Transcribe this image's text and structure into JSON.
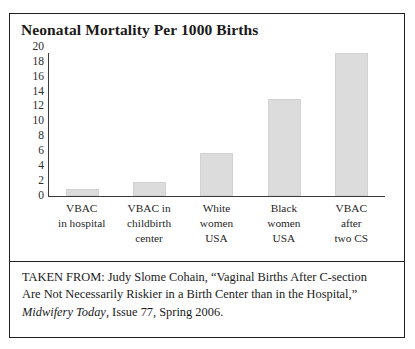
{
  "figure": {
    "title": "Neonatal Mortality Per 1000 Births"
  },
  "chart_data": {
    "type": "bar",
    "title": "Neonatal Mortality Per 1000 Births",
    "xlabel": "",
    "ylabel": "",
    "ylim": [
      0,
      20
    ],
    "ytick_step": 2,
    "grid": false,
    "legend": false,
    "bar_color": "#dcdcdc",
    "categories": [
      "VBAC in hospital",
      "VBAC in childbirth center",
      "White women USA",
      "Black women USA",
      "VBAC after two CS"
    ],
    "category_lines": [
      [
        "VBAC",
        "in hospital"
      ],
      [
        "VBAC in",
        "childbirth",
        "center"
      ],
      [
        "White",
        "women",
        "USA"
      ],
      [
        "Black",
        "women",
        "USA"
      ],
      [
        "VBAC",
        "after",
        "two CS"
      ]
    ],
    "values": [
      1,
      2,
      6,
      13.5,
      20
    ],
    "yticks": [
      0,
      2,
      4,
      6,
      8,
      10,
      12,
      14,
      16,
      18,
      20
    ]
  },
  "caption": {
    "line1": "TAKEN FROM: Judy Slome Cohain, “Vaginal Births After C-section",
    "line2": "Are Not Necessarily Riskier in a Birth Center than in the Hospital,”",
    "journal": "Midwifery Today",
    "line3_rest": ", Issue 77, Spring 2006."
  }
}
